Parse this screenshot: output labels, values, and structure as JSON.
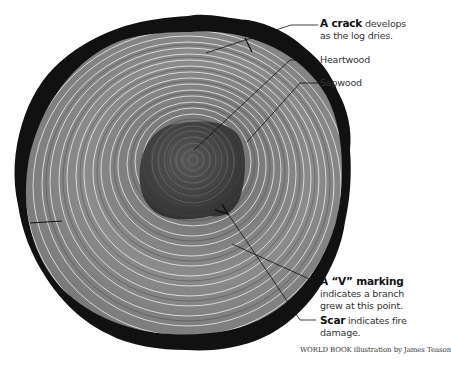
{
  "diagram": {
    "colors": {
      "bark": "#111111",
      "sapwood": "#9a9a9a",
      "heartwood": "#3a3a3a",
      "ring_line": "#ffffff",
      "leader_line": "#111111",
      "background": "#ffffff"
    },
    "labels": [
      {
        "id": "crack",
        "bold": "A crack",
        "text": " develops as the log dries."
      },
      {
        "id": "heartwood",
        "bold": "",
        "text": "Heartwood"
      },
      {
        "id": "sapwood",
        "bold": "",
        "text": "Sapwood"
      },
      {
        "id": "v-marking",
        "bold": "A “V” marking",
        "text": " indicates a branch grew at this point."
      },
      {
        "id": "scar",
        "bold": "Scar",
        "text": " indicates fire damage."
      }
    ],
    "credit": "WORLD BOOK illustration by James Teason"
  }
}
